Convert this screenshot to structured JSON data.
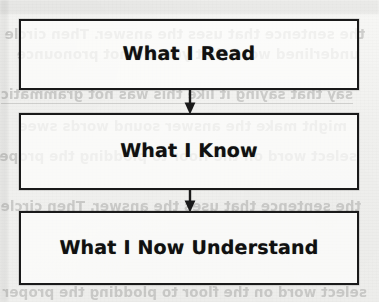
{
  "document": {
    "type": "flowchart",
    "title": "Reading comprehension flow chart",
    "medium": "photocopied worksheet page"
  },
  "colors": {
    "paper": "#f3f3f1",
    "ink": "#1a1a1a",
    "box_fill": "#fdfdfc",
    "bleed_text": "#9a9a98"
  },
  "flow": {
    "nodes": [
      {
        "id": "read",
        "label": "What I Read"
      },
      {
        "id": "know",
        "label": "What I Know"
      },
      {
        "id": "understand",
        "label": "What I Now Understand"
      }
    ],
    "connectors": [
      {
        "id": "read-to-know",
        "from": "read",
        "to": "know",
        "glyph": "down-arrow"
      },
      {
        "id": "know-to-understand",
        "from": "know",
        "to": "understand",
        "glyph": "down-arrow"
      }
    ]
  },
  "bleed_through": {
    "note": "faint mirrored text showing through from the reverse side of the page",
    "lines": [
      "the sentence that uses the answer. Then circle",
      "underlined word that you did not pronounce",
      "say that saying it like this was not grammatic",
      "might make the answer sound  words  swee",
      "select word on the floor to plodding the proper"
    ]
  }
}
